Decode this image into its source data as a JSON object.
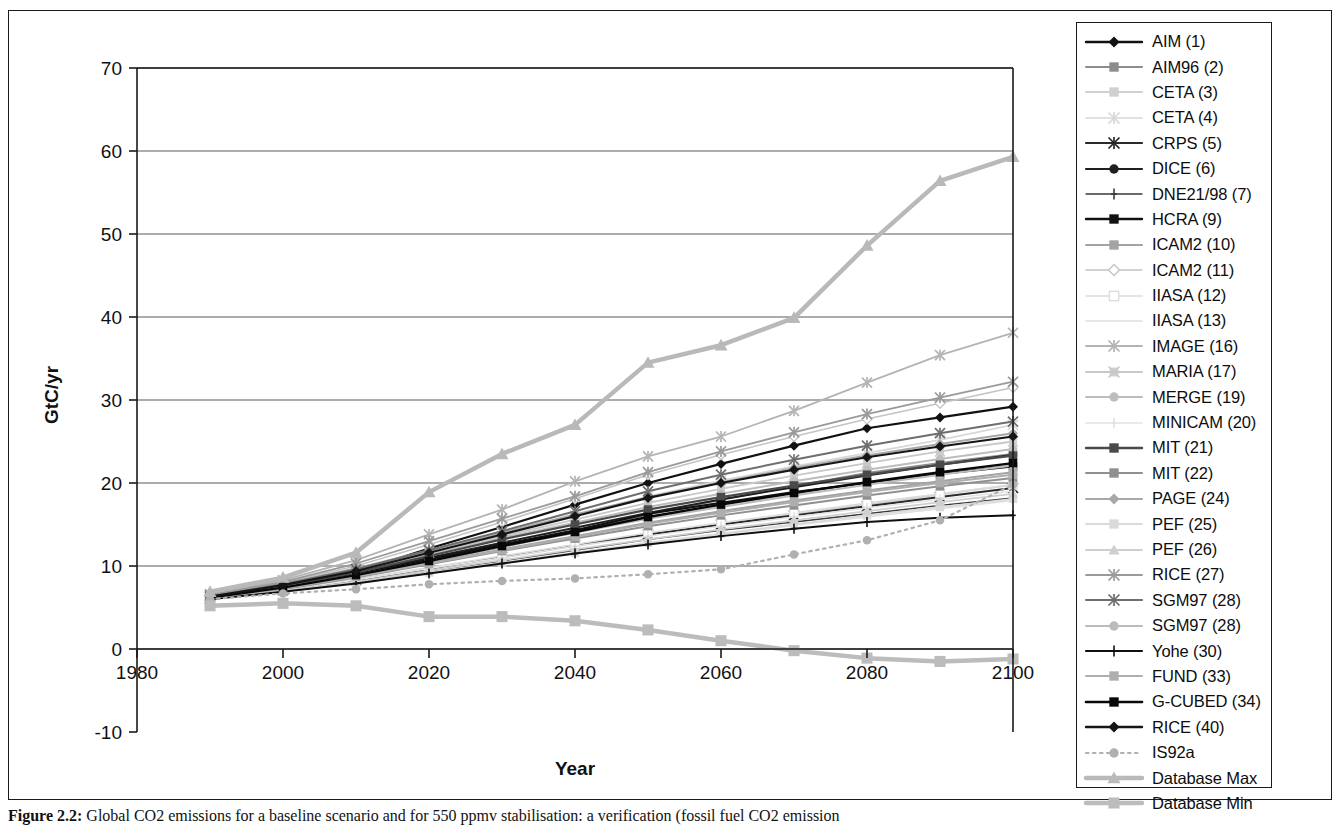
{
  "figure": {
    "caption_label": "Figure 2.2:",
    "caption_text": "Global CO2 emissions for a baseline scenario and for 550 ppmv stabilisation: a verification (fossil fuel CO2 emission"
  },
  "axes": {
    "ylabel": "GtC/yr",
    "xlabel": "Year",
    "yticks": [
      70,
      60,
      50,
      40,
      30,
      20,
      10,
      0,
      -10
    ],
    "xticks": [
      1980,
      2000,
      2020,
      2040,
      2060,
      2080,
      2100
    ],
    "ylim": [
      -10,
      70
    ],
    "xlim": [
      1980,
      2100
    ],
    "grid": "horizontal"
  },
  "chart_data": {
    "type": "line",
    "title": "",
    "xlabel": "Year",
    "ylabel": "GtC/yr",
    "ylim": [
      -10,
      70
    ],
    "xlim": [
      1980,
      2100
    ],
    "x": [
      1990,
      2000,
      2010,
      2020,
      2030,
      2040,
      2050,
      2060,
      2070,
      2080,
      2090,
      2100
    ],
    "series": [
      {
        "name": "AIM (1)",
        "marker": "diamond",
        "color": "#111111",
        "width": 2.2,
        "dash": "none",
        "values": [
          6.2,
          7.6,
          9.3,
          12.1,
          14.7,
          17.4,
          20.0,
          22.3,
          24.5,
          26.6,
          27.9,
          29.2
        ]
      },
      {
        "name": "AIM96 (2)",
        "marker": "square",
        "color": "#8d8d8d",
        "width": 2.0,
        "dash": "none",
        "values": [
          6.1,
          7.3,
          8.8,
          10.6,
          12.3,
          14.2,
          16.2,
          18.0,
          19.6,
          21.2,
          22.4,
          23.5
        ]
      },
      {
        "name": "CETA (3)",
        "marker": "square",
        "color": "#d0d0d0",
        "width": 2.0,
        "dash": "none",
        "values": [
          6.0,
          7.0,
          8.2,
          9.6,
          11.0,
          12.4,
          13.7,
          15.0,
          16.2,
          17.4,
          18.6,
          19.8
        ]
      },
      {
        "name": "CETA (4)",
        "marker": "star",
        "color": "#d8d8d8",
        "width": 1.6,
        "dash": "none",
        "values": [
          6.3,
          7.6,
          9.4,
          11.8,
          14.0,
          16.1,
          18.4,
          20.3,
          22.0,
          23.6,
          25.2,
          27.0
        ]
      },
      {
        "name": "CRPS (5)",
        "marker": "star",
        "color": "#2a2a2a",
        "width": 2.0,
        "dash": "none",
        "values": [
          6.0,
          7.1,
          8.3,
          9.7,
          11.1,
          12.5,
          13.8,
          15.0,
          16.1,
          17.2,
          18.3,
          19.4
        ]
      },
      {
        "name": "DICE (6)",
        "marker": "circle",
        "color": "#1f1f1f",
        "width": 2.0,
        "dash": "none",
        "values": [
          6.1,
          7.5,
          9.1,
          11.0,
          12.8,
          14.6,
          16.4,
          18.0,
          19.5,
          20.9,
          22.2,
          23.4
        ]
      },
      {
        "name": "DNE21/98 (7)",
        "marker": "plus",
        "color": "#3a3a3a",
        "width": 1.4,
        "dash": "none",
        "values": [
          6.0,
          7.0,
          8.0,
          9.4,
          10.6,
          11.9,
          13.2,
          14.3,
          15.3,
          16.3,
          17.3,
          18.2
        ]
      },
      {
        "name": "HCRA (9)",
        "marker": "square",
        "color": "#121212",
        "width": 2.2,
        "dash": "none",
        "values": [
          6.2,
          7.5,
          9.0,
          10.8,
          12.6,
          14.3,
          16.3,
          17.6,
          18.9,
          20.0,
          21.1,
          22.0
        ]
      },
      {
        "name": "ICAM2 (10)",
        "marker": "square",
        "color": "#a3a3a3",
        "width": 2.0,
        "dash": "none",
        "values": [
          6.3,
          7.4,
          8.8,
          10.4,
          12.0,
          13.6,
          15.2,
          16.6,
          17.9,
          19.1,
          20.2,
          21.3
        ]
      },
      {
        "name": "ICAM2 (11)",
        "marker": "diamond-open",
        "color": "#c4c4c4",
        "width": 1.6,
        "dash": "none",
        "values": [
          6.5,
          8.0,
          10.0,
          12.6,
          15.3,
          18.1,
          21.0,
          23.4,
          25.6,
          27.7,
          29.6,
          31.5
        ]
      },
      {
        "name": "IIASA (12)",
        "marker": "square-open",
        "color": "#dcdcdc",
        "width": 1.6,
        "dash": "none",
        "values": [
          6.2,
          7.2,
          8.4,
          9.8,
          11.2,
          12.6,
          14.0,
          15.2,
          16.4,
          17.6,
          18.7,
          19.8
        ]
      },
      {
        "name": "IIASA (13)",
        "marker": "none",
        "color": "#e0e0e0",
        "width": 1.6,
        "dash": "none",
        "values": [
          6.0,
          6.9,
          7.9,
          9.1,
          10.3,
          11.5,
          12.7,
          13.8,
          14.9,
          15.9,
          16.9,
          17.9
        ]
      },
      {
        "name": "IMAGE (16)",
        "marker": "star",
        "color": "#b4b4b4",
        "width": 1.8,
        "dash": "none",
        "values": [
          6.6,
          8.3,
          10.7,
          13.8,
          16.8,
          20.2,
          23.2,
          25.6,
          28.7,
          32.1,
          35.4,
          38.1
        ]
      },
      {
        "name": "MARIA (17)",
        "marker": "star-box",
        "color": "#c8c8c8",
        "width": 1.8,
        "dash": "none",
        "values": [
          6.4,
          7.8,
          9.6,
          11.6,
          13.6,
          15.6,
          17.6,
          19.3,
          20.9,
          22.4,
          23.8,
          25.0
        ]
      },
      {
        "name": "MERGE (19)",
        "marker": "circle",
        "color": "#bdbdbd",
        "width": 2.0,
        "dash": "none",
        "values": [
          6.3,
          7.7,
          9.4,
          11.4,
          13.4,
          15.2,
          17.1,
          18.7,
          20.2,
          21.6,
          22.9,
          24.1
        ]
      },
      {
        "name": "MINICAM (20)",
        "marker": "plus",
        "color": "#e3e3e3",
        "width": 1.5,
        "dash": "none",
        "values": [
          6.1,
          7.1,
          8.3,
          9.7,
          11.0,
          12.4,
          13.6,
          14.8,
          15.9,
          17.0,
          18.0,
          19.0
        ]
      },
      {
        "name": "MIT (21)",
        "marker": "square",
        "color": "#4a4a4a",
        "width": 2.2,
        "dash": "none",
        "values": [
          6.2,
          7.6,
          9.2,
          11.2,
          13.2,
          15.0,
          16.8,
          18.3,
          19.7,
          21.0,
          22.2,
          23.3
        ]
      },
      {
        "name": "MIT (22)",
        "marker": "square",
        "color": "#909090",
        "width": 2.0,
        "dash": "none",
        "values": [
          6.0,
          7.2,
          8.6,
          10.2,
          11.8,
          13.3,
          14.8,
          16.1,
          17.3,
          18.5,
          19.6,
          20.6
        ]
      },
      {
        "name": "PAGE (24)",
        "marker": "diamond",
        "color": "#a8a8a8",
        "width": 2.0,
        "dash": "none",
        "values": [
          6.4,
          7.9,
          9.7,
          11.9,
          14.0,
          16.2,
          18.3,
          20.1,
          21.8,
          23.3,
          24.7,
          26.0
        ]
      },
      {
        "name": "PEF (25)",
        "marker": "square",
        "color": "#dadada",
        "width": 1.8,
        "dash": "none",
        "values": [
          6.0,
          6.9,
          8.0,
          9.2,
          10.4,
          11.6,
          12.8,
          13.9,
          15.0,
          16.1,
          17.1,
          18.1
        ]
      },
      {
        "name": "PEF (26)",
        "marker": "triangle",
        "color": "#cfcfcf",
        "width": 1.8,
        "dash": "none",
        "values": [
          6.1,
          7.0,
          8.1,
          9.4,
          10.7,
          12.0,
          13.2,
          14.4,
          15.5,
          16.6,
          17.7,
          18.7
        ]
      },
      {
        "name": "RICE (27)",
        "marker": "star",
        "color": "#9a9a9a",
        "width": 1.8,
        "dash": "none",
        "values": [
          6.5,
          8.1,
          10.3,
          13.0,
          15.7,
          18.4,
          21.3,
          23.8,
          26.1,
          28.3,
          30.3,
          32.2
        ]
      },
      {
        "name": "SGM97 (28)",
        "marker": "star",
        "color": "#6e6e6e",
        "width": 2.0,
        "dash": "none",
        "values": [
          6.3,
          7.8,
          9.6,
          11.9,
          14.2,
          16.6,
          19.0,
          21.0,
          22.8,
          24.5,
          26.0,
          27.4
        ]
      },
      {
        "name": "SGM97 (28)",
        "marker": "circle",
        "color": "#bbbbbb",
        "width": 2.0,
        "dash": "none",
        "values": [
          6.2,
          7.4,
          8.9,
          10.6,
          12.3,
          14.0,
          15.7,
          17.1,
          18.5,
          19.8,
          21.0,
          22.1
        ]
      },
      {
        "name": "Yohe (30)",
        "marker": "plus",
        "color": "#0f0f0f",
        "width": 2.0,
        "dash": "none",
        "values": [
          6.0,
          6.9,
          7.9,
          9.1,
          10.3,
          11.5,
          12.6,
          13.6,
          14.5,
          15.3,
          15.8,
          16.1
        ]
      },
      {
        "name": "FUND (33)",
        "marker": "square",
        "color": "#aeaeae",
        "width": 2.0,
        "dash": "none",
        "values": [
          6.1,
          7.3,
          8.7,
          10.3,
          11.9,
          13.5,
          15.1,
          16.4,
          17.7,
          18.9,
          20.0,
          21.0
        ]
      },
      {
        "name": "G-CUBED (34)",
        "marker": "square",
        "color": "#080808",
        "width": 2.4,
        "dash": "none",
        "values": [
          6.2,
          7.4,
          8.9,
          10.6,
          12.4,
          14.1,
          15.9,
          17.4,
          18.8,
          20.1,
          21.3,
          22.4
        ]
      },
      {
        "name": "RICE (40)",
        "marker": "diamond",
        "color": "#151515",
        "width": 2.2,
        "dash": "none",
        "values": [
          6.3,
          7.7,
          9.4,
          11.6,
          13.8,
          16.0,
          18.2,
          20.0,
          21.6,
          23.1,
          24.4,
          25.6
        ]
      },
      {
        "name": "IS92a",
        "marker": "circle",
        "color": "#b0b0b0",
        "width": 2.0,
        "dash": "dotted",
        "values": [
          6.0,
          6.7,
          7.2,
          7.8,
          8.2,
          8.5,
          9.0,
          9.6,
          11.4,
          13.1,
          15.5,
          19.8
        ]
      },
      {
        "name": "Database Max",
        "marker": "triangle",
        "color": "#b9b9b9",
        "width": 4.5,
        "dash": "none",
        "values": [
          6.9,
          8.6,
          11.6,
          18.9,
          23.5,
          27.0,
          34.5,
          36.6,
          39.9,
          48.6,
          56.4,
          59.3
        ]
      },
      {
        "name": "Database Min",
        "marker": "square",
        "color": "#bcbcbc",
        "width": 4.5,
        "dash": "none",
        "values": [
          5.2,
          5.5,
          5.2,
          3.9,
          3.9,
          3.4,
          2.3,
          1.0,
          -0.2,
          -1.1,
          -1.5,
          -1.2
        ]
      }
    ]
  },
  "legend": {
    "items": [
      {
        "label": "AIM (1)",
        "marker": "diamond",
        "color": "#111111",
        "width": 2.4,
        "dash": "none"
      },
      {
        "label": "AIM96 (2)",
        "marker": "square",
        "color": "#8d8d8d",
        "width": 2.0,
        "dash": "none"
      },
      {
        "label": "CETA (3)",
        "marker": "square",
        "color": "#d0d0d0",
        "width": 2.0,
        "dash": "none"
      },
      {
        "label": "CETA (4)",
        "marker": "star",
        "color": "#d8d8d8",
        "width": 1.6,
        "dash": "none"
      },
      {
        "label": "CRPS (5)",
        "marker": "star",
        "color": "#2a2a2a",
        "width": 2.2,
        "dash": "none"
      },
      {
        "label": "DICE (6)",
        "marker": "circle",
        "color": "#1f1f1f",
        "width": 2.2,
        "dash": "none"
      },
      {
        "label": "DNE21/98 (7)",
        "marker": "plus",
        "color": "#3a3a3a",
        "width": 1.4,
        "dash": "none"
      },
      {
        "label": "HCRA (9)",
        "marker": "square",
        "color": "#121212",
        "width": 2.4,
        "dash": "none"
      },
      {
        "label": "ICAM2 (10)",
        "marker": "square",
        "color": "#a3a3a3",
        "width": 2.0,
        "dash": "none"
      },
      {
        "label": "ICAM2 (11)",
        "marker": "diamond-open",
        "color": "#c4c4c4",
        "width": 1.6,
        "dash": "none"
      },
      {
        "label": "IIASA (12)",
        "marker": "square-open",
        "color": "#dcdcdc",
        "width": 1.6,
        "dash": "none"
      },
      {
        "label": "IIASA (13)",
        "marker": "none",
        "color": "#e0e0e0",
        "width": 1.6,
        "dash": "none"
      },
      {
        "label": "IMAGE (16)",
        "marker": "star",
        "color": "#b4b4b4",
        "width": 1.8,
        "dash": "none"
      },
      {
        "label": "MARIA (17)",
        "marker": "star-box",
        "color": "#c8c8c8",
        "width": 1.8,
        "dash": "none"
      },
      {
        "label": "MERGE (19)",
        "marker": "circle",
        "color": "#bdbdbd",
        "width": 2.0,
        "dash": "none"
      },
      {
        "label": "MINICAM (20)",
        "marker": "plus",
        "color": "#e3e3e3",
        "width": 1.5,
        "dash": "none"
      },
      {
        "label": "MIT (21)",
        "marker": "square",
        "color": "#4a4a4a",
        "width": 2.4,
        "dash": "none"
      },
      {
        "label": "MIT (22)",
        "marker": "square",
        "color": "#909090",
        "width": 2.0,
        "dash": "none"
      },
      {
        "label": "PAGE (24)",
        "marker": "diamond",
        "color": "#a8a8a8",
        "width": 2.0,
        "dash": "none"
      },
      {
        "label": "PEF (25)",
        "marker": "square",
        "color": "#dadada",
        "width": 1.8,
        "dash": "none"
      },
      {
        "label": "PEF (26)",
        "marker": "triangle",
        "color": "#cfcfcf",
        "width": 1.8,
        "dash": "none"
      },
      {
        "label": "RICE (27)",
        "marker": "star",
        "color": "#9a9a9a",
        "width": 1.8,
        "dash": "none"
      },
      {
        "label": "SGM97 (28)",
        "marker": "star",
        "color": "#6e6e6e",
        "width": 2.2,
        "dash": "none"
      },
      {
        "label": "SGM97 (28)",
        "marker": "circle",
        "color": "#bbbbbb",
        "width": 2.0,
        "dash": "none"
      },
      {
        "label": "Yohe (30)",
        "marker": "plus",
        "color": "#0f0f0f",
        "width": 2.2,
        "dash": "none"
      },
      {
        "label": "FUND (33)",
        "marker": "square",
        "color": "#aeaeae",
        "width": 2.0,
        "dash": "none"
      },
      {
        "label": "G-CUBED (34)",
        "marker": "square",
        "color": "#080808",
        "width": 2.6,
        "dash": "none"
      },
      {
        "label": "RICE (40)",
        "marker": "diamond",
        "color": "#151515",
        "width": 2.4,
        "dash": "none"
      },
      {
        "label": "IS92a",
        "marker": "circle",
        "color": "#b0b0b0",
        "width": 2.0,
        "dash": "dotted"
      },
      {
        "label": "Database Max",
        "marker": "triangle",
        "color": "#b9b9b9",
        "width": 4.5,
        "dash": "none"
      },
      {
        "label": "Database Min",
        "marker": "square",
        "color": "#bcbcbc",
        "width": 4.5,
        "dash": "none"
      }
    ]
  },
  "colors": {
    "frame": "#1a1a1a",
    "grid": "#5a5a5a",
    "text": "#111111",
    "background": "#ffffff"
  }
}
